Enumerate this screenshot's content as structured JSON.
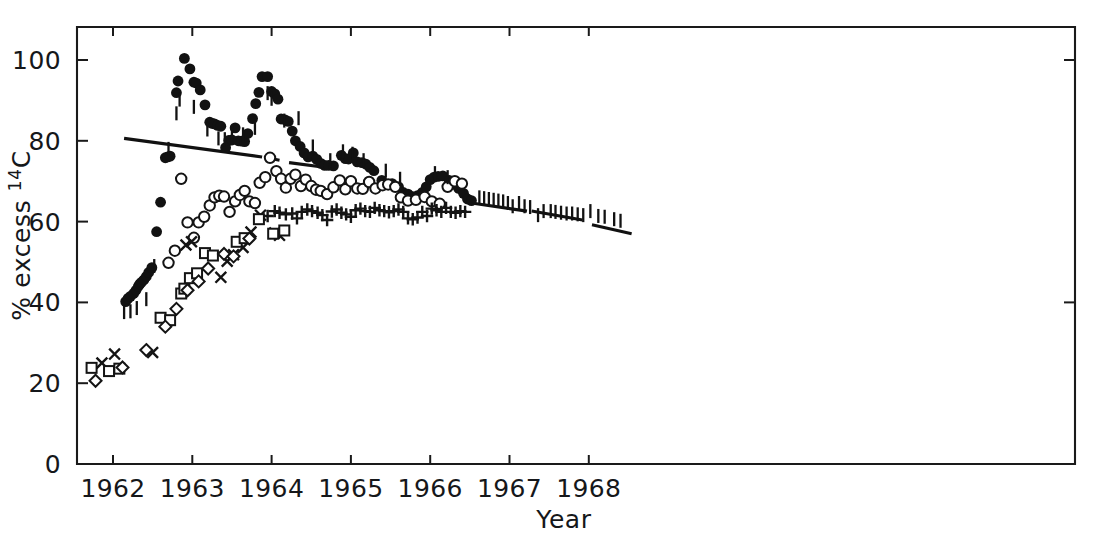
{
  "figure": {
    "caption_visible": false,
    "background_color": "#ffffff",
    "ink_color": "#121212"
  },
  "chart_data": {
    "type": "scatter",
    "title": "",
    "xlabel": "Year",
    "ylabel": "% excess 14C",
    "ylabel_parts": {
      "text": "% excess ",
      "superscript": "14",
      "element": "C"
    },
    "xlim": [
      1961.5,
      1968.6
    ],
    "ylim": [
      0,
      107
    ],
    "grid": false,
    "legend": "none",
    "xticks": [
      1962,
      1963,
      1964,
      1965,
      1966,
      1967,
      1968
    ],
    "xticklabels": [
      "1962",
      "1963",
      "1964",
      "1965",
      "1966",
      "1967",
      "1968"
    ],
    "yticks": [
      0,
      20,
      40,
      60,
      80,
      100
    ],
    "yticklabels": [
      "0",
      "20",
      "40",
      "60",
      "80",
      "100"
    ],
    "axis_frame": "top-left-right-bottom",
    "tick_direction": "inward-top-outward-bottom",
    "series": [
      {
        "name": "tropospheric northern air (filled circles)",
        "marker": "filled-circle",
        "points": [
          [
            1962.16,
            40.2
          ],
          [
            1962.19,
            41.0
          ],
          [
            1962.22,
            41.5
          ],
          [
            1962.26,
            42.2
          ],
          [
            1962.29,
            43.0
          ],
          [
            1962.32,
            44.0
          ],
          [
            1962.34,
            44.6
          ],
          [
            1962.36,
            45.0
          ],
          [
            1962.39,
            45.6
          ],
          [
            1962.42,
            46.4
          ],
          [
            1962.45,
            47.4
          ],
          [
            1962.49,
            48.6
          ],
          [
            1962.55,
            57.5
          ],
          [
            1962.6,
            64.8
          ],
          [
            1962.66,
            75.8
          ],
          [
            1962.69,
            76.0
          ],
          [
            1962.72,
            76.2
          ],
          [
            1962.8,
            91.9
          ],
          [
            1962.82,
            94.8
          ],
          [
            1962.9,
            100.4
          ],
          [
            1962.97,
            97.8
          ],
          [
            1963.02,
            94.5
          ],
          [
            1963.05,
            94.3
          ],
          [
            1963.1,
            92.6
          ],
          [
            1963.16,
            88.9
          ],
          [
            1963.22,
            84.6
          ],
          [
            1963.25,
            84.3
          ],
          [
            1963.28,
            84.2
          ],
          [
            1963.32,
            83.8
          ],
          [
            1963.36,
            83.6
          ],
          [
            1963.42,
            78.3
          ],
          [
            1963.46,
            80.1
          ],
          [
            1963.5,
            80.2
          ],
          [
            1963.54,
            83.2
          ],
          [
            1963.58,
            80.0
          ],
          [
            1963.62,
            79.9
          ],
          [
            1963.66,
            79.8
          ],
          [
            1963.7,
            81.8
          ],
          [
            1963.76,
            85.5
          ],
          [
            1963.8,
            89.2
          ],
          [
            1963.84,
            92.0
          ],
          [
            1963.88,
            95.9
          ],
          [
            1963.95,
            95.9
          ],
          [
            1964.0,
            92.2
          ],
          [
            1964.04,
            91.6
          ],
          [
            1964.08,
            90.3
          ],
          [
            1964.12,
            85.4
          ],
          [
            1964.17,
            85.2
          ],
          [
            1964.21,
            84.8
          ],
          [
            1964.26,
            82.4
          ],
          [
            1964.3,
            80.0
          ],
          [
            1964.36,
            78.6
          ],
          [
            1964.41,
            77.0
          ],
          [
            1964.46,
            76.0
          ],
          [
            1964.52,
            76.2
          ],
          [
            1964.57,
            75.4
          ],
          [
            1964.62,
            74.4
          ],
          [
            1964.67,
            73.9
          ],
          [
            1964.72,
            73.9
          ],
          [
            1964.78,
            73.8
          ],
          [
            1964.88,
            76.4
          ],
          [
            1964.93,
            75.6
          ],
          [
            1964.97,
            75.5
          ],
          [
            1965.03,
            77.0
          ],
          [
            1965.08,
            74.8
          ],
          [
            1965.14,
            74.6
          ],
          [
            1965.19,
            74.2
          ],
          [
            1965.24,
            73.4
          ],
          [
            1965.29,
            72.6
          ],
          [
            1965.39,
            70.2
          ],
          [
            1965.46,
            69.2
          ],
          [
            1965.52,
            69.4
          ],
          [
            1965.6,
            68.6
          ],
          [
            1965.66,
            67.2
          ],
          [
            1965.72,
            66.8
          ],
          [
            1965.78,
            66.2
          ],
          [
            1965.84,
            66.4
          ],
          [
            1965.9,
            67.2
          ],
          [
            1965.95,
            68.6
          ],
          [
            1966.0,
            70.4
          ],
          [
            1966.05,
            71.0
          ],
          [
            1966.1,
            71.2
          ],
          [
            1966.16,
            71.3
          ],
          [
            1966.24,
            70.2
          ],
          [
            1966.3,
            69.2
          ],
          [
            1966.36,
            68.2
          ],
          [
            1966.42,
            67.0
          ],
          [
            1966.47,
            65.6
          ],
          [
            1966.52,
            65.2
          ]
        ]
      },
      {
        "name": "surface ocean / southern air (open circles)",
        "marker": "open-circle",
        "points": [
          [
            1962.7,
            49.8
          ],
          [
            1962.78,
            52.8
          ],
          [
            1962.86,
            70.6
          ],
          [
            1962.94,
            59.8
          ],
          [
            1963.02,
            56.0
          ],
          [
            1963.08,
            59.8
          ],
          [
            1963.15,
            61.2
          ],
          [
            1963.22,
            64.0
          ],
          [
            1963.28,
            66.0
          ],
          [
            1963.34,
            66.4
          ],
          [
            1963.4,
            66.2
          ],
          [
            1963.47,
            62.4
          ],
          [
            1963.54,
            65.0
          ],
          [
            1963.6,
            66.6
          ],
          [
            1963.66,
            67.6
          ],
          [
            1963.72,
            65.0
          ],
          [
            1963.79,
            64.6
          ],
          [
            1963.85,
            69.6
          ],
          [
            1963.92,
            71.0
          ],
          [
            1963.98,
            75.8
          ],
          [
            1964.06,
            72.5
          ],
          [
            1964.12,
            70.6
          ],
          [
            1964.18,
            68.4
          ],
          [
            1964.24,
            70.6
          ],
          [
            1964.3,
            71.6
          ],
          [
            1964.37,
            68.8
          ],
          [
            1964.43,
            70.4
          ],
          [
            1964.5,
            68.8
          ],
          [
            1964.56,
            67.9
          ],
          [
            1964.62,
            67.6
          ],
          [
            1964.7,
            66.8
          ],
          [
            1964.78,
            68.5
          ],
          [
            1964.86,
            70.2
          ],
          [
            1964.93,
            68.0
          ],
          [
            1965.0,
            70.0
          ],
          [
            1965.08,
            68.2
          ],
          [
            1965.15,
            68.1
          ],
          [
            1965.23,
            69.8
          ],
          [
            1965.31,
            68.2
          ],
          [
            1965.4,
            69.0
          ],
          [
            1965.47,
            69.2
          ],
          [
            1965.56,
            68.6
          ],
          [
            1965.63,
            66.0
          ],
          [
            1965.72,
            65.2
          ],
          [
            1965.82,
            65.4
          ],
          [
            1965.93,
            66.1
          ],
          [
            1966.02,
            65.0
          ],
          [
            1966.12,
            64.4
          ],
          [
            1966.22,
            68.6
          ],
          [
            1966.31,
            70.0
          ],
          [
            1966.4,
            69.4
          ]
        ]
      },
      {
        "name": "mixed layer water (plus)",
        "marker": "plus",
        "points": [
          [
            1963.95,
            61.4
          ],
          [
            1964.04,
            62.6
          ],
          [
            1964.1,
            62.2
          ],
          [
            1964.18,
            61.8
          ],
          [
            1964.26,
            62.0
          ],
          [
            1964.32,
            60.8
          ],
          [
            1964.38,
            62.4
          ],
          [
            1964.45,
            63.0
          ],
          [
            1964.51,
            62.6
          ],
          [
            1964.58,
            62.2
          ],
          [
            1964.64,
            61.6
          ],
          [
            1964.7,
            60.4
          ],
          [
            1964.76,
            62.5
          ],
          [
            1964.82,
            63.0
          ],
          [
            1964.88,
            62.2
          ],
          [
            1964.94,
            61.8
          ],
          [
            1965.0,
            61.2
          ],
          [
            1965.06,
            62.8
          ],
          [
            1965.12,
            63.2
          ],
          [
            1965.18,
            62.6
          ],
          [
            1965.24,
            62.4
          ],
          [
            1965.3,
            63.4
          ],
          [
            1965.36,
            62.8
          ],
          [
            1965.42,
            62.6
          ],
          [
            1965.48,
            62.3
          ],
          [
            1965.54,
            62.6
          ],
          [
            1965.6,
            63.0
          ],
          [
            1965.66,
            62.4
          ],
          [
            1965.72,
            60.8
          ],
          [
            1965.78,
            60.6
          ],
          [
            1965.84,
            61.0
          ],
          [
            1965.9,
            62.4
          ],
          [
            1965.96,
            61.4
          ],
          [
            1966.02,
            63.2
          ],
          [
            1966.08,
            62.8
          ],
          [
            1966.14,
            62.4
          ],
          [
            1966.2,
            63.4
          ],
          [
            1966.26,
            62.4
          ],
          [
            1966.32,
            62.2
          ],
          [
            1966.38,
            62.6
          ],
          [
            1966.44,
            62.4
          ]
        ]
      },
      {
        "name": "sub-surface water (cross)",
        "marker": "cross",
        "points": [
          [
            1961.86,
            25.0
          ],
          [
            1962.02,
            27.2
          ],
          [
            1962.5,
            27.6
          ],
          [
            1962.92,
            54.2
          ],
          [
            1962.99,
            55.0
          ],
          [
            1963.36,
            46.2
          ],
          [
            1963.44,
            50.2
          ],
          [
            1963.52,
            51.8
          ],
          [
            1963.64,
            53.6
          ],
          [
            1963.74,
            57.4
          ],
          [
            1963.86,
            61.6
          ],
          [
            1964.04,
            57.2
          ],
          [
            1964.1,
            56.6
          ]
        ]
      },
      {
        "name": "deep water A (open square)",
        "marker": "square",
        "points": [
          [
            1961.73,
            23.8
          ],
          [
            1961.95,
            23.0
          ],
          [
            1962.08,
            23.6
          ],
          [
            1962.6,
            36.2
          ],
          [
            1962.72,
            35.6
          ],
          [
            1962.86,
            42.2
          ],
          [
            1962.9,
            43.4
          ],
          [
            1962.97,
            46.0
          ],
          [
            1963.06,
            47.2
          ],
          [
            1963.16,
            52.2
          ],
          [
            1963.26,
            51.6
          ],
          [
            1963.56,
            55.0
          ],
          [
            1963.66,
            55.9
          ],
          [
            1963.84,
            60.6
          ],
          [
            1964.02,
            57.0
          ],
          [
            1964.16,
            57.8
          ]
        ]
      },
      {
        "name": "deep water B (open diamond)",
        "marker": "diamond",
        "points": [
          [
            1961.78,
            20.6
          ],
          [
            1962.12,
            23.9
          ],
          [
            1962.42,
            28.2
          ],
          [
            1962.66,
            34.0
          ],
          [
            1962.8,
            38.4
          ],
          [
            1962.94,
            43.0
          ],
          [
            1963.08,
            45.2
          ],
          [
            1963.2,
            48.4
          ],
          [
            1963.4,
            52.0
          ],
          [
            1963.52,
            51.4
          ],
          [
            1963.72,
            55.8
          ]
        ]
      },
      {
        "name": "error-bar-only measurements",
        "marker": "vertical-bar",
        "points": [
          [
            1962.14,
            37.6
          ],
          [
            1962.22,
            37.8
          ],
          [
            1962.3,
            38.6
          ],
          [
            1962.42,
            40.8
          ],
          [
            1962.52,
            49.0
          ],
          [
            1962.7,
            78.0
          ],
          [
            1962.8,
            86.8
          ],
          [
            1962.84,
            90.2
          ],
          [
            1963.02,
            88.4
          ],
          [
            1963.19,
            82.8
          ],
          [
            1963.33,
            80.6
          ],
          [
            1963.41,
            80.4
          ],
          [
            1963.5,
            82.2
          ],
          [
            1963.64,
            81.6
          ],
          [
            1963.79,
            83.2
          ],
          [
            1963.95,
            91.8
          ],
          [
            1964.0,
            90.4
          ],
          [
            1964.16,
            85.0
          ],
          [
            1964.34,
            85.6
          ],
          [
            1964.52,
            78.6
          ],
          [
            1964.74,
            75.2
          ],
          [
            1964.9,
            77.4
          ],
          [
            1965.02,
            76.8
          ],
          [
            1965.16,
            75.2
          ],
          [
            1965.44,
            72.6
          ],
          [
            1965.62,
            70.6
          ],
          [
            1966.06,
            72.0
          ],
          [
            1966.22,
            71.0
          ],
          [
            1966.62,
            66.0
          ],
          [
            1966.68,
            65.8
          ],
          [
            1966.74,
            65.6
          ],
          [
            1966.8,
            65.4
          ],
          [
            1966.86,
            65.2
          ],
          [
            1966.92,
            65.0
          ],
          [
            1966.98,
            64.6
          ],
          [
            1967.04,
            63.8
          ],
          [
            1967.12,
            64.6
          ],
          [
            1967.19,
            63.8
          ],
          [
            1967.26,
            63.6
          ],
          [
            1967.36,
            61.6
          ],
          [
            1967.43,
            62.6
          ],
          [
            1967.52,
            62.6
          ],
          [
            1967.58,
            62.4
          ],
          [
            1967.65,
            62.2
          ],
          [
            1967.72,
            62.0
          ],
          [
            1967.79,
            62.0
          ],
          [
            1967.86,
            61.8
          ],
          [
            1967.93,
            61.6
          ],
          [
            1968.02,
            62.6
          ],
          [
            1968.12,
            61.4
          ],
          [
            1968.2,
            61.2
          ],
          [
            1968.32,
            60.6
          ],
          [
            1968.4,
            60.2
          ]
        ]
      }
    ],
    "trend_lines": [
      {
        "name": "upper-trend-segment-1",
        "x1": 1962.14,
        "y1": 80.6,
        "x2": 1963.88,
        "y2": 76.0
      },
      {
        "name": "upper-trend-segment-2",
        "x1": 1963.99,
        "y1": 75.6,
        "x2": 1964.1,
        "y2": 75.2
      },
      {
        "name": "upper-trend-segment-3",
        "x1": 1964.22,
        "y1": 74.6,
        "x2": 1964.69,
        "y2": 73.4
      },
      {
        "name": "lower-trend-segment-1",
        "x1": 1966.52,
        "y1": 64.6,
        "x2": 1967.22,
        "y2": 62.6
      },
      {
        "name": "lower-trend-segment-2",
        "x1": 1967.28,
        "y1": 62.6,
        "x2": 1967.92,
        "y2": 60.4
      },
      {
        "name": "lower-trend-segment-3",
        "x1": 1968.04,
        "y1": 59.2,
        "x2": 1968.54,
        "y2": 57.0
      }
    ]
  }
}
